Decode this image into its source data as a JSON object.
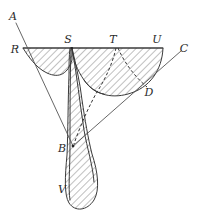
{
  "figure": {
    "type": "geometric-diagram",
    "background_color": "#ffffff",
    "stroke_color": "#3a3a3a",
    "hatch_color": "#4a4a4a",
    "width": 200,
    "height": 216,
    "labels": [
      {
        "id": "A",
        "text": "A",
        "x": 13,
        "y": 20
      },
      {
        "id": "R",
        "text": "R",
        "x": 15,
        "y": 53
      },
      {
        "id": "S",
        "text": "S",
        "x": 68,
        "y": 43
      },
      {
        "id": "T",
        "text": "T",
        "x": 113,
        "y": 43
      },
      {
        "id": "U",
        "text": "U",
        "x": 157,
        "y": 43
      },
      {
        "id": "C",
        "text": "C",
        "x": 184,
        "y": 52
      },
      {
        "id": "D",
        "text": "D",
        "x": 149,
        "y": 96
      },
      {
        "id": "B",
        "text": "B",
        "x": 62,
        "y": 152
      },
      {
        "id": "V",
        "text": "V",
        "x": 62,
        "y": 193
      }
    ],
    "points": {
      "A": {
        "x": 16,
        "y": 23
      },
      "R": {
        "x": 23,
        "y": 48
      },
      "S": {
        "x": 72,
        "y": 48
      },
      "T": {
        "x": 116,
        "y": 48
      },
      "U": {
        "x": 163,
        "y": 48
      },
      "C": {
        "x": 181,
        "y": 51
      },
      "D": {
        "x": 147,
        "y": 88
      },
      "B": {
        "x": 73,
        "y": 146
      },
      "V": {
        "x": 78,
        "y": 205
      },
      "M": {
        "x": 100,
        "y": 91
      }
    },
    "segments": [
      {
        "name": "ray-A-through-R-to-B",
        "from": "A",
        "to": "B"
      },
      {
        "name": "ray-C-through-D-to-B",
        "from": "C",
        "to": "B"
      },
      {
        "name": "baseline-R-to-U",
        "from": "R",
        "to": "U"
      }
    ],
    "dashed_paths": [
      {
        "name": "dashed-T-to-B",
        "from": "T",
        "to": "B"
      }
    ],
    "hatch": {
      "angle_degrees": 45,
      "spacing_px": 5,
      "line_width": 0.7
    },
    "regions": [
      {
        "name": "region-R-S-concave-lune"
      },
      {
        "name": "region-S-T-U-D-half-disc"
      },
      {
        "name": "region-S-B-V-tail"
      }
    ]
  }
}
